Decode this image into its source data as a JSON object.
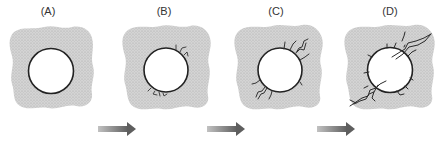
{
  "diagram": {
    "stages": [
      {
        "id": "A",
        "label": "(A)",
        "description": "intact hole, no cracks"
      },
      {
        "id": "B",
        "label": "(B)",
        "description": "small microcracks initiate at hole boundary"
      },
      {
        "id": "C",
        "label": "(C)",
        "description": "cracks grow outward from the hole"
      },
      {
        "id": "D",
        "label": "(D)",
        "description": "cracks coalesce into long fractures through the matrix"
      }
    ],
    "arrows": [
      {
        "from": "A",
        "to": "B"
      },
      {
        "from": "B",
        "to": "C"
      },
      {
        "from": "C",
        "to": "D"
      }
    ],
    "colors": {
      "matrix": "#cfcfcf",
      "matrix_dots": "#a8a8a8",
      "hole_fill": "#ffffff",
      "outline": "#222222",
      "arrow_start": "#b5b5b5",
      "arrow_end": "#6e6e6e"
    }
  }
}
